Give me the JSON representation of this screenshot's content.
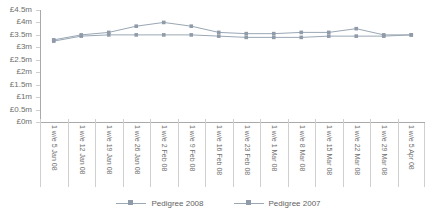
{
  "chart_data": {
    "type": "line",
    "title": "",
    "subtitle": "",
    "xlabel": "",
    "ylabel": "",
    "grid": false,
    "legend_position": "bottom",
    "ylim": [
      0,
      4.5
    ],
    "y_ticks": [
      0,
      0.5,
      1,
      1.5,
      2,
      2.5,
      3,
      3.5,
      4,
      4.5
    ],
    "y_tick_labels": [
      "£0m",
      "£0.5m",
      "£1m",
      "£1.5m",
      "£2m",
      "£2.5m",
      "£3m",
      "£3.5m",
      "£4m",
      "£4.5m"
    ],
    "categories": [
      "1 w/e 5 Jan 08",
      "1 w/e 12 Jan 08",
      "1 w/e 19 Jan 08",
      "1 w/e 26 Jan 08",
      "1 w/e 2 Feb 08",
      "1 w/e 9 Feb 08",
      "1 w/e 16 Feb 08",
      "1 w/e 23 Feb 08",
      "1 w/e 1 Mar 08",
      "1 w/e 8 Mar 08",
      "1 w/e 15 Mar 08",
      "1 w/e 22 Mar 08",
      "1 w/e 29 Mar 08",
      "1 w/e 5 Apr 08"
    ],
    "series": [
      {
        "name": "Pedigree 2008",
        "color": "#9aa7b4",
        "marker": "square",
        "values": [
          3.25,
          3.45,
          3.5,
          3.5,
          3.5,
          3.5,
          3.45,
          3.4,
          3.4,
          3.4,
          3.45,
          3.45,
          3.45,
          3.5
        ]
      },
      {
        "name": "Pedigree 2007",
        "color": "#9aa7b4",
        "marker": "square",
        "values": [
          3.3,
          3.5,
          3.6,
          3.85,
          4.0,
          3.85,
          3.6,
          3.55,
          3.55,
          3.6,
          3.6,
          3.75,
          3.5,
          3.5
        ]
      }
    ]
  },
  "legend": {
    "entries": [
      {
        "label": "Pedigree 2008"
      },
      {
        "label": "Pedigree 2007"
      }
    ]
  },
  "colors": {
    "series_line": "#9aa7b4",
    "marker_fill": "#8f9ba8",
    "axis": "#a9a9a9",
    "grid_divider": "#cfcfcf",
    "text": "#6e6e6e"
  }
}
